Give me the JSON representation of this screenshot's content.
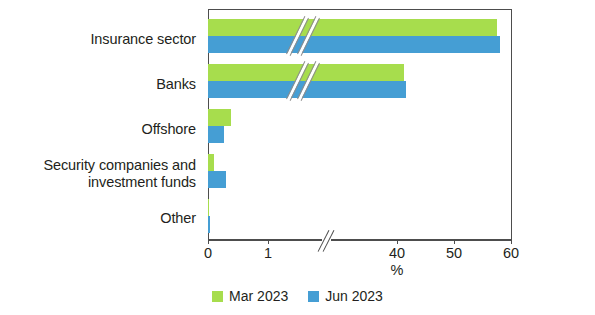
{
  "chart_data": {
    "type": "bar",
    "orientation": "horizontal",
    "title": "",
    "subtitle": "",
    "xlabel": "%",
    "ylabel": "",
    "categories": [
      "Insurance sector",
      "Banks",
      "Offshore",
      "Security companies and\ninvestment funds",
      "Other"
    ],
    "series": [
      {
        "name": "Mar 2023",
        "color": "#a7dd4d",
        "values": [
          57.6,
          41.3,
          0.38,
          0.1,
          0.02
        ]
      },
      {
        "name": "Jun 2023",
        "color": "#459ed4",
        "values": [
          58.1,
          41.6,
          0.27,
          0.3,
          0.03
        ]
      }
    ],
    "xlim": [
      0,
      70
    ],
    "xticks": [
      0,
      1,
      40,
      50,
      60,
      70
    ],
    "xtick_labels": [
      "0",
      "1",
      "40",
      "50",
      "60",
      "70"
    ],
    "axis_break": {
      "present": true,
      "between": [
        1,
        40
      ],
      "note": "axis is broken between 1 and 40; bars crossing the break are marked with double diagonal slashes"
    },
    "grid": false,
    "legend_position": "bottom-center"
  },
  "legend": {
    "items": [
      {
        "label": "Mar 2023",
        "color": "#a7dd4d"
      },
      {
        "label": "Jun 2023",
        "color": "#459ed4"
      }
    ]
  },
  "axis": {
    "x_title": "%",
    "ticks": [
      {
        "label": "0",
        "value": 0
      },
      {
        "label": "1",
        "value": 1
      },
      {
        "label": "40",
        "value": 40
      },
      {
        "label": "50",
        "value": 50
      },
      {
        "label": "60",
        "value": 60
      },
      {
        "label": "70",
        "value": 70
      }
    ]
  },
  "colors": {
    "mar_2023": "#a7dd4d",
    "jun_2023": "#459ed4",
    "axis": "#4d4d4d",
    "text": "#231f20",
    "background": "#ffffff"
  }
}
